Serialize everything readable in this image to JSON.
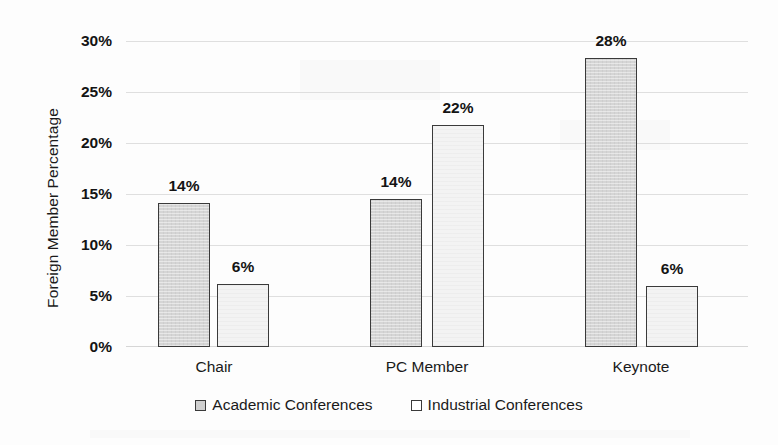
{
  "chart_data": {
    "type": "bar",
    "title": "",
    "xlabel": "",
    "ylabel": "Foreign Member Percentage",
    "categories": [
      "Chair",
      "PC Member",
      "Keynote"
    ],
    "ylim": [
      0,
      30
    ],
    "ytick_values": [
      30,
      25,
      20,
      15,
      10,
      5,
      0
    ],
    "ytick_labels": [
      "30%",
      "25%",
      "20%",
      "15%",
      "10%",
      "5%",
      "0%"
    ],
    "grid": true,
    "legend_position": "bottom-center",
    "series": [
      {
        "name": "Academic Conferences",
        "values": [
          14.2,
          14.6,
          28.4
        ],
        "labels": [
          "14%",
          "14%",
          "28%"
        ],
        "fill": "#d5d5d5",
        "stroke": "#3a3a3a"
      },
      {
        "name": "Industrial Conferences",
        "values": [
          6.2,
          21.8,
          6.0
        ],
        "labels": [
          "6%",
          "22%",
          "6%"
        ],
        "fill": "#f3f3f3",
        "stroke": "#3a3a3a"
      }
    ]
  },
  "legend": {
    "items": [
      {
        "label": "Academic Conferences",
        "marker": "filled-square-marker"
      },
      {
        "label": "Industrial Conferences",
        "marker": "hollow-square-marker"
      }
    ]
  },
  "colors": {
    "academic_fill": "#d5d5d5",
    "industrial_fill": "#f3f3f3",
    "bar_outline": "#3a3a3a",
    "gridline": "#d9d9d9",
    "text": "#1a1a1a",
    "page_background": "#fdfdfd"
  }
}
